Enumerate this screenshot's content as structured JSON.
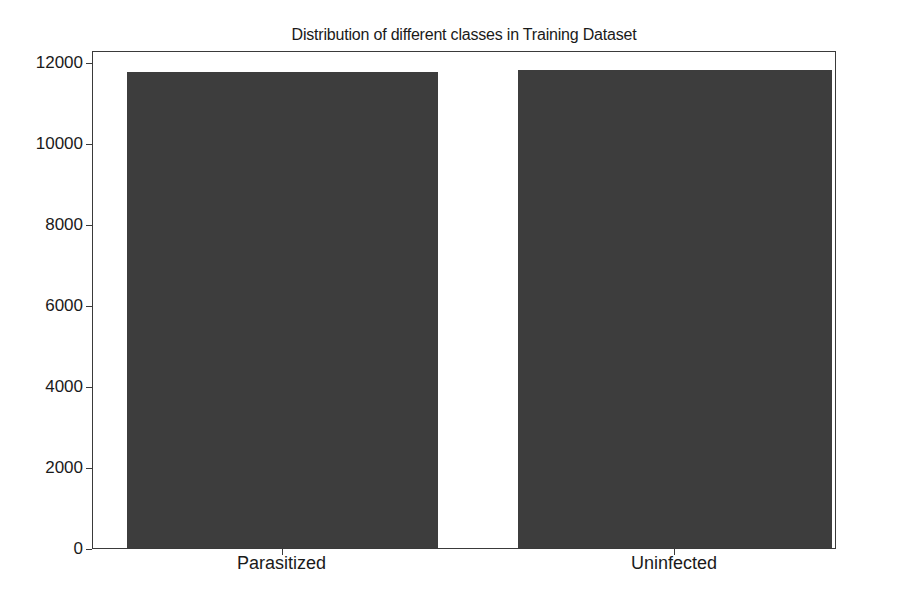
{
  "chart_data": {
    "type": "bar",
    "title": "Distribution of different classes in Training Dataset",
    "categories": [
      "Parasitized",
      "Uninfected"
    ],
    "values": [
      11760,
      11810
    ],
    "xlabel": "",
    "ylabel": "",
    "ylim": [
      0,
      12300
    ],
    "yticks": [
      0,
      2000,
      4000,
      6000,
      8000,
      10000,
      12000
    ],
    "ytick_labels": [
      "0",
      "2000",
      "4000",
      "6000",
      "8000",
      "10000",
      "12000"
    ],
    "grid": false,
    "legend": null,
    "bar_color": "#3d3d3d"
  },
  "layout": {
    "plot_left": 92,
    "plot_top": 51,
    "plot_width": 744,
    "plot_height": 498,
    "bars": [
      {
        "left": 126,
        "width": 311
      },
      {
        "left": 517,
        "width": 314
      }
    ]
  }
}
